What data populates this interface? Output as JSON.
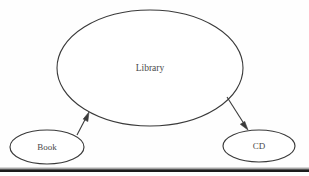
{
  "diagram": {
    "background_color": "#fefefe",
    "stroke_color": "#3a3a3a",
    "text_color": "#4a4a4a",
    "rule_color": "#1c1c1c",
    "nodes": [
      {
        "id": "library",
        "label": "Library",
        "shape": "ellipse",
        "cx": 150,
        "cy": 68,
        "rx": 93,
        "ry": 58
      },
      {
        "id": "book",
        "label": "Book",
        "shape": "ellipse",
        "cx": 47,
        "cy": 147,
        "rx": 37,
        "ry": 17
      },
      {
        "id": "cd",
        "label": "CD",
        "shape": "ellipse",
        "cx": 259,
        "cy": 146,
        "rx": 36,
        "ry": 16
      }
    ],
    "edges": [
      {
        "id": "book-to-library",
        "from": "book",
        "to": "library",
        "x1": 77,
        "y1": 135,
        "x2": 89,
        "y2": 112,
        "arrowhead": "end"
      },
      {
        "id": "library-to-cd",
        "from": "library",
        "to": "cd",
        "x1": 227,
        "y1": 97,
        "x2": 248,
        "y2": 130,
        "arrowhead": "end"
      }
    ],
    "rule": {
      "id": "bottom-rule",
      "x1": 0,
      "x2": 309,
      "y": 170
    }
  }
}
